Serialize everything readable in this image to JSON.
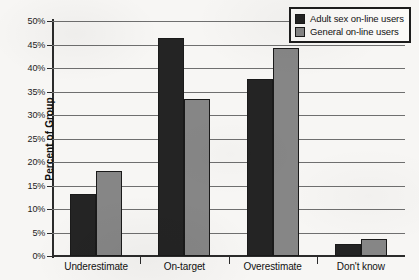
{
  "chart_data": {
    "type": "bar",
    "title": "",
    "xlabel": "",
    "ylabel": "Percent of Group",
    "ylim": [
      0,
      50
    ],
    "ytick_values": [
      0,
      5,
      10,
      15,
      20,
      25,
      30,
      35,
      40,
      45,
      50
    ],
    "ytick_labels": [
      "0%",
      "5%",
      "10%",
      "15%",
      "20%",
      "25%",
      "30%",
      "35%",
      "40%",
      "45%",
      "50%"
    ],
    "categories": [
      "Underestimate",
      "On-target",
      "Overestimate",
      "Don't know"
    ],
    "series": [
      {
        "name": "Adult sex on-line users",
        "color": "#242424",
        "values": [
          13.3,
          46.4,
          37.6,
          2.5
        ]
      },
      {
        "name": "General on-line users",
        "color": "#868686",
        "values": [
          18.1,
          33.4,
          44.2,
          3.6
        ]
      }
    ],
    "grid": true,
    "grid_axis": "y",
    "legend_position": "top-right"
  }
}
